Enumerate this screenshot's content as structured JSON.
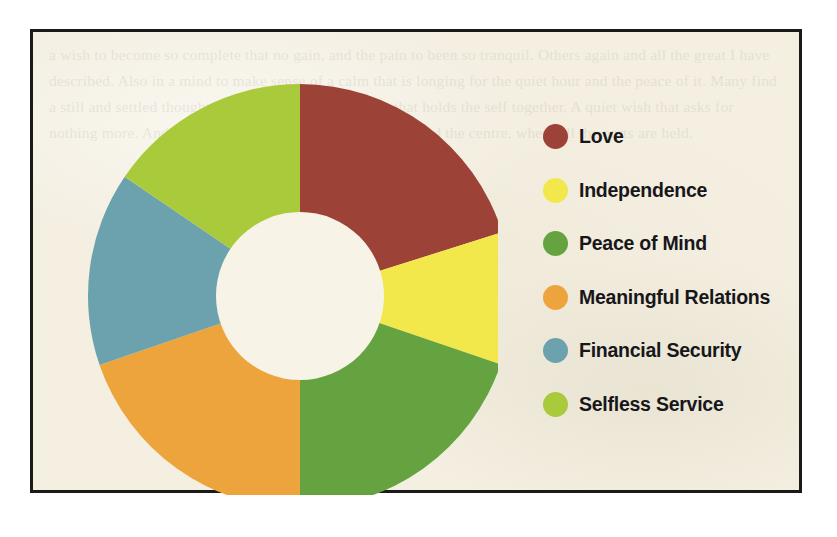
{
  "panel": {
    "background_color": "#f4efe1",
    "border_color": "#1a1a18",
    "bleedthrough_text": "a wish to become so complete that no gain, and the pain to been so tranquil. Others again and all the great I have described. Also in a mind to make sense of a calm that is longing for the quiet hour and the peace of it. Many find a still and settled thought, some other restful moment that holds the self together. A quiet wish that asks for nothing more. And so the round of feeling turns again toward the centre, where all the parts are held."
  },
  "chart_data": {
    "type": "pie",
    "title": "",
    "subtitle": "",
    "xlabel": "",
    "ylabel": "",
    "donut": true,
    "inner_radius_ratio": 0.396,
    "start_angle_deg": 0,
    "direction": "clockwise",
    "legend_position": "right",
    "grid": false,
    "categories": [
      "Love",
      "Independence",
      "Peace of Mind",
      "Meaningful Relations",
      "Financial Security",
      "Selfless Service"
    ],
    "values": [
      20.1,
      10.1,
      19.8,
      19.7,
      14.8,
      15.5
    ],
    "value_unit": "percent",
    "colors": [
      "#9c4236",
      "#f2e84c",
      "#64a340",
      "#eea43c",
      "#6ba2ad",
      "#a9ca3b"
    ],
    "slices": [
      {
        "label": "Love",
        "value": 20.1,
        "color": "#9c4236",
        "start_deg": 0.0,
        "end_deg": 72.5
      },
      {
        "label": "Independence",
        "value": 10.1,
        "color": "#f2e84c",
        "start_deg": 72.5,
        "end_deg": 108.8
      },
      {
        "label": "Peace of Mind",
        "value": 19.8,
        "color": "#64a340",
        "start_deg": 108.8,
        "end_deg": 180.0
      },
      {
        "label": "Meaningful Relations",
        "value": 19.7,
        "color": "#eea43c",
        "start_deg": 180.0,
        "end_deg": 251.0
      },
      {
        "label": "Financial Security",
        "value": 14.8,
        "color": "#6ba2ad",
        "start_deg": 251.0,
        "end_deg": 304.2
      },
      {
        "label": "Selfless Service",
        "value": 15.5,
        "color": "#a9ca3b",
        "start_deg": 304.2,
        "end_deg": 360.0
      }
    ],
    "geometry": {
      "center_x": 242,
      "center_y": 271,
      "outer_radius": 212,
      "inner_radius": 84,
      "hole_color": "#f7f3e7"
    }
  },
  "legend": {
    "items": [
      {
        "label": "Love",
        "color": "#9c4236"
      },
      {
        "label": "Independence",
        "color": "#f2e84c"
      },
      {
        "label": "Peace of Mind",
        "color": "#64a340"
      },
      {
        "label": "Meaningful Relations",
        "color": "#eea43c"
      },
      {
        "label": "Financial Security",
        "color": "#6ba2ad"
      },
      {
        "label": "Selfless Service",
        "color": "#a9ca3b"
      }
    ]
  }
}
